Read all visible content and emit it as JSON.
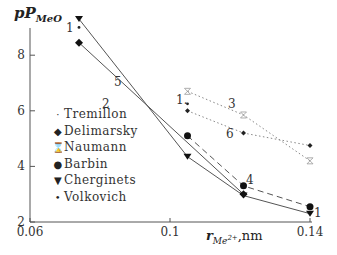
{
  "chart_data": {
    "type": "line",
    "title": "",
    "ylabel": "pP_MeO",
    "xlabel": "r_Me2+, nm",
    "xlim": [
      0.06,
      0.14
    ],
    "ylim": [
      2,
      9.5
    ],
    "xticks": [
      "0.06",
      "0.1",
      "0.14"
    ],
    "yticks": [
      "2",
      "4",
      "6",
      "8"
    ],
    "grid": false,
    "legend_position": "inside-left",
    "series": [
      {
        "name": "Tremillon",
        "marker": "dot",
        "curve_label": "1",
        "line": "none",
        "points": [
          [
            0.074,
            9.0
          ],
          [
            0.105,
            6.25
          ]
        ]
      },
      {
        "name": "Delimarsky",
        "marker": "diamond",
        "curve_label": "2",
        "line": "solid",
        "points": [
          [
            0.074,
            8.45
          ],
          [
            0.121,
            3.0
          ]
        ]
      },
      {
        "name": "Naumann",
        "marker": "hourglass",
        "curve_label": "3",
        "line": "dotted",
        "points": [
          [
            0.105,
            6.7
          ],
          [
            0.121,
            5.85
          ],
          [
            0.14,
            4.2
          ]
        ]
      },
      {
        "name": "Barbin",
        "marker": "circle",
        "curve_label": "4",
        "line": "dashed",
        "points": [
          [
            0.105,
            5.1
          ],
          [
            0.121,
            3.3
          ],
          [
            0.14,
            2.55
          ]
        ]
      },
      {
        "name": "Cherginets",
        "marker": "triangle-down",
        "curve_label": "5",
        "line": "solid",
        "points": [
          [
            0.074,
            9.3
          ],
          [
            0.105,
            4.35
          ],
          [
            0.121,
            2.95
          ],
          [
            0.14,
            2.3
          ]
        ]
      },
      {
        "name": "Volkovich",
        "marker": "diamond-small",
        "curve_label": "6",
        "line": "dotted",
        "points": [
          [
            0.105,
            6.0
          ],
          [
            0.121,
            5.2
          ],
          [
            0.14,
            4.75
          ]
        ]
      }
    ],
    "annotations": [
      "1",
      "2",
      "3",
      "4",
      "5",
      "6",
      "1",
      "1"
    ]
  },
  "axis": {
    "y_label_main": "pP",
    "y_label_sub": "MeO",
    "x_label_main": "r",
    "x_label_sub": "Me",
    "x_label_sup": "2+",
    "x_label_unit": ",nm"
  },
  "legend": [
    {
      "label": "Tremillon",
      "glyph": "·"
    },
    {
      "label": "Delimarsky",
      "glyph": "◆"
    },
    {
      "label": "Naumann",
      "glyph": "⌛"
    },
    {
      "label": "Barbin",
      "glyph": "●"
    },
    {
      "label": "Cherginets",
      "glyph": "▼"
    },
    {
      "label": "Volkovich",
      "glyph": "•"
    }
  ]
}
